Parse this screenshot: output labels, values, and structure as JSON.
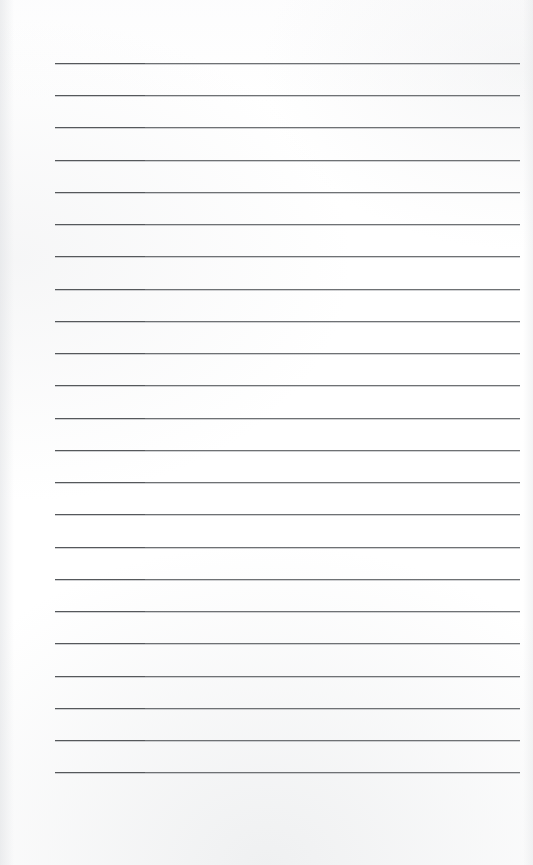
{
  "document": {
    "type": "scanned-lined-paper",
    "title": "Blank Ruled Notebook Page",
    "content_text": "",
    "page_width": 533,
    "page_height": 865,
    "background_color": "#ffffff",
    "has_handwriting": false,
    "has_printed_text": false
  },
  "ruling": {
    "line_count": 23,
    "first_line_y": 63,
    "line_spacing": 32.2,
    "line_left_x": 55,
    "line_right_x": 520,
    "line_width": 465,
    "line_thickness": 1,
    "line_color": "#6e7174",
    "line_left_segment_color": "#55585b",
    "left_segment_width": 90,
    "top_margin": 63,
    "bottom_margin": 93,
    "left_margin": 55,
    "right_margin": 13
  },
  "lines": [
    {
      "index": 1,
      "y": 63,
      "text": ""
    },
    {
      "index": 2,
      "y": 95,
      "text": ""
    },
    {
      "index": 3,
      "y": 127,
      "text": ""
    },
    {
      "index": 4,
      "y": 160,
      "text": ""
    },
    {
      "index": 5,
      "y": 192,
      "text": ""
    },
    {
      "index": 6,
      "y": 224,
      "text": ""
    },
    {
      "index": 7,
      "y": 256,
      "text": ""
    },
    {
      "index": 8,
      "y": 289,
      "text": ""
    },
    {
      "index": 9,
      "y": 321,
      "text": ""
    },
    {
      "index": 10,
      "y": 353,
      "text": ""
    },
    {
      "index": 11,
      "y": 385,
      "text": ""
    },
    {
      "index": 12,
      "y": 418,
      "text": ""
    },
    {
      "index": 13,
      "y": 450,
      "text": ""
    },
    {
      "index": 14,
      "y": 482,
      "text": ""
    },
    {
      "index": 15,
      "y": 514,
      "text": ""
    },
    {
      "index": 16,
      "y": 547,
      "text": ""
    },
    {
      "index": 17,
      "y": 579,
      "text": ""
    },
    {
      "index": 18,
      "y": 611,
      "text": ""
    },
    {
      "index": 19,
      "y": 643,
      "text": ""
    },
    {
      "index": 20,
      "y": 676,
      "text": ""
    },
    {
      "index": 21,
      "y": 708,
      "text": ""
    },
    {
      "index": 22,
      "y": 740,
      "text": ""
    },
    {
      "index": 23,
      "y": 772,
      "text": ""
    }
  ]
}
